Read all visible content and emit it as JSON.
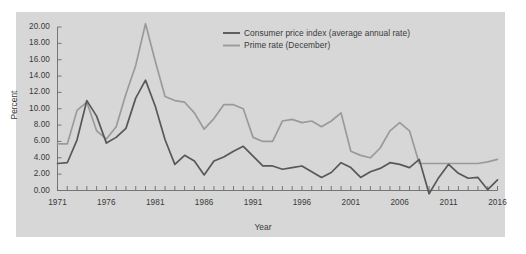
{
  "figure": {
    "panel_color": "#d7d7d7",
    "page_color": "#ffffff"
  },
  "axes": {
    "ytitle": "Percent",
    "xtitle": "Year",
    "yticks": [
      "0.00",
      "2.00",
      "4.00",
      "6.00",
      "8.00",
      "10.00",
      "12.00",
      "14.00",
      "16.00",
      "18.00",
      "20.00"
    ],
    "xticks": [
      "1971",
      "1976",
      "1981",
      "1986",
      "1991",
      "1996",
      "2001",
      "2006",
      "2011",
      "2016"
    ]
  },
  "legend": {
    "items": [
      {
        "label": "Consumer price index (average annual rate)",
        "color": "#58585a"
      },
      {
        "label": "Prime rate (December)",
        "color": "#9a9a9c"
      }
    ]
  },
  "chart_data": {
    "type": "line",
    "title": "",
    "xlabel": "Year",
    "ylabel": "Percent",
    "xlim": [
      1971,
      2016
    ],
    "ylim": [
      0,
      20
    ],
    "grid": false,
    "legend_position": "top-center",
    "x": [
      1971,
      1972,
      1973,
      1974,
      1975,
      1976,
      1977,
      1978,
      1979,
      1980,
      1981,
      1982,
      1983,
      1984,
      1985,
      1986,
      1987,
      1988,
      1989,
      1990,
      1991,
      1992,
      1993,
      1994,
      1995,
      1996,
      1997,
      1998,
      1999,
      2000,
      2001,
      2002,
      2003,
      2004,
      2005,
      2006,
      2007,
      2008,
      2009,
      2010,
      2011,
      2012,
      2013,
      2014,
      2015,
      2016
    ],
    "series": [
      {
        "name": "Consumer price index (average annual rate)",
        "color": "#58585a",
        "values": [
          3.3,
          3.4,
          6.2,
          11.0,
          9.1,
          5.8,
          6.5,
          7.6,
          11.3,
          13.5,
          10.3,
          6.2,
          3.2,
          4.3,
          3.6,
          1.9,
          3.6,
          4.1,
          4.8,
          5.4,
          4.2,
          3.0,
          3.0,
          2.6,
          2.8,
          3.0,
          2.3,
          1.6,
          2.2,
          3.4,
          2.8,
          1.6,
          2.3,
          2.7,
          3.4,
          3.2,
          2.8,
          3.8,
          -0.4,
          1.6,
          3.2,
          2.1,
          1.5,
          1.6,
          0.1,
          1.3
        ]
      },
      {
        "name": "Prime rate (December)",
        "color": "#9a9a9c",
        "values": [
          5.7,
          5.7,
          9.8,
          10.8,
          7.3,
          6.3,
          7.8,
          11.8,
          15.3,
          20.4,
          15.8,
          11.5,
          11.0,
          10.8,
          9.5,
          7.5,
          8.8,
          10.5,
          10.5,
          10.0,
          6.5,
          6.0,
          6.0,
          8.5,
          8.7,
          8.3,
          8.5,
          7.8,
          8.5,
          9.5,
          4.8,
          4.3,
          4.0,
          5.2,
          7.3,
          8.3,
          7.3,
          3.3,
          3.3,
          3.3,
          3.3,
          3.3,
          3.3,
          3.3,
          3.5,
          3.8
        ]
      }
    ]
  }
}
